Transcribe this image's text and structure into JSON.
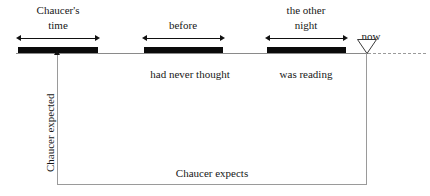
{
  "diagram": {
    "title_text": "Chaucer tense timeline diagram",
    "colors": {
      "bar": "#0b0b0b",
      "timeline": "#8a8a8a",
      "box": "#9a9a9a",
      "arrow": "#111111",
      "text": "#171717",
      "background": "#ffffff"
    },
    "intervals": [
      {
        "id": "chaucers-time",
        "top_label_line1": "Chaucer's",
        "top_label_line2": "time",
        "bottom_label": "",
        "bar_x": 18,
        "bar_width": 80
      },
      {
        "id": "before",
        "top_label_line1": "",
        "top_label_line2": "before",
        "bottom_label": "had never thought",
        "bar_x": 144,
        "bar_width": 79
      },
      {
        "id": "the-other-night",
        "top_label_line1": "the other",
        "top_label_line2": "night",
        "bottom_label": "was reading",
        "bar_x": 267,
        "bar_width": 79
      }
    ],
    "now_label": "now",
    "vertical_axis_label": "Chaucer expected",
    "box_label": "Chaucer expects"
  }
}
